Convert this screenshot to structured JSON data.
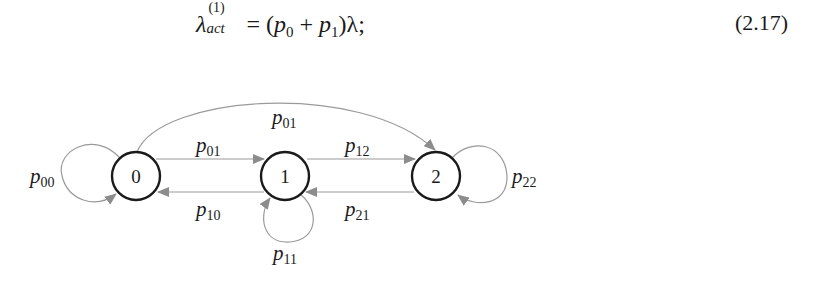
{
  "equation": {
    "lhs_symbol": "λ",
    "lhs_superscript": "(1)",
    "lhs_subscript": "act",
    "equals": "=",
    "rhs_open": "(",
    "term1": "p",
    "term1_sub": "0",
    "plus": "+",
    "term2": "p",
    "term2_sub": "1",
    "rhs_close": ")λ;",
    "number": "(2.17)"
  },
  "diagram": {
    "nodes": [
      {
        "id": "0",
        "label": "0"
      },
      {
        "id": "1",
        "label": "1"
      },
      {
        "id": "2",
        "label": "2"
      }
    ],
    "edges": [
      {
        "from": "0",
        "to": "0",
        "label": "p",
        "sub": "00"
      },
      {
        "from": "0",
        "to": "1",
        "label": "p",
        "sub": "01"
      },
      {
        "from": "1",
        "to": "0",
        "label": "p",
        "sub": "10"
      },
      {
        "from": "1",
        "to": "1",
        "label": "p",
        "sub": "11"
      },
      {
        "from": "1",
        "to": "2",
        "label": "p",
        "sub": "12"
      },
      {
        "from": "2",
        "to": "1",
        "label": "p",
        "sub": "21"
      },
      {
        "from": "2",
        "to": "2",
        "label": "p",
        "sub": "22"
      },
      {
        "from": "0",
        "to": "2",
        "label": "p",
        "sub": "01"
      }
    ],
    "colors": {
      "node_stroke": "#1a1a1a",
      "edge": "#9a9a9a",
      "arrow": "#8c8c8c"
    }
  }
}
